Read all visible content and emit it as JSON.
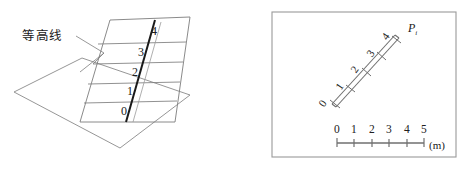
{
  "page": {
    "width": 465,
    "height": 169,
    "background": "#ffffff",
    "cropped_top_text": "。。。。。。。。。。。。。。。。。。。。。。"
  },
  "colors": {
    "line": "#6f6f6f",
    "thick_line": "#1a1a1a",
    "text": "#202020",
    "border": "#9a9a9a"
  },
  "left_figure": {
    "name": "contour-plane-3d-diagram",
    "callout_label": "等高线",
    "contour_values": [
      "0",
      "1",
      "2",
      "3",
      "4"
    ],
    "ground_plane": "horizontal base parallelogram",
    "vertical_plane": "slanted upright parallelogram with contour lines",
    "slope_line": "thick diagonal slope line"
  },
  "right_figure": {
    "name": "map-view-panel",
    "point_label": "P",
    "point_subscript": "i",
    "tick_values": [
      "0",
      "1",
      "2",
      "3",
      "4"
    ],
    "scale_bar": {
      "ticks": [
        "0",
        "1",
        "2",
        "3",
        "4",
        "5"
      ],
      "unit": "(m)"
    }
  }
}
